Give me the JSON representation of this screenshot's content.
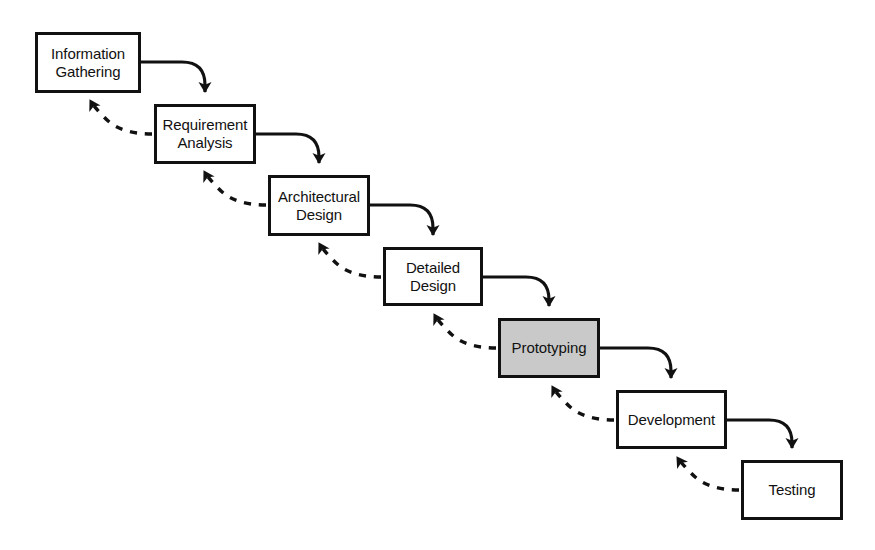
{
  "diagram": {
    "type": "process-flow",
    "canvas": {
      "width": 875,
      "height": 550
    },
    "colors": {
      "background": "#ffffff",
      "stroke": "#111111",
      "node_fill": "#ffffff",
      "highlight_fill": "#c9c9c9"
    },
    "nodes": [
      {
        "id": "information-gathering",
        "label": "Information\nGathering",
        "x": 35,
        "y": 32,
        "w": 106,
        "h": 61,
        "highlighted": false
      },
      {
        "id": "requirement-analysis",
        "label": "Requirement\nAnalysis",
        "x": 154,
        "y": 104,
        "w": 102,
        "h": 60,
        "highlighted": false
      },
      {
        "id": "architectural-design",
        "label": "Architectural\nDesign",
        "x": 268,
        "y": 175,
        "w": 102,
        "h": 61,
        "highlighted": false
      },
      {
        "id": "detailed-design",
        "label": "Detailed\nDesign",
        "x": 383,
        "y": 247,
        "w": 100,
        "h": 59,
        "highlighted": false
      },
      {
        "id": "prototyping",
        "label": "Prototyping",
        "x": 498,
        "y": 318,
        "w": 102,
        "h": 60,
        "highlighted": true
      },
      {
        "id": "development",
        "label": "Development",
        "x": 616,
        "y": 390,
        "w": 111,
        "h": 59,
        "highlighted": false
      },
      {
        "id": "testing",
        "label": "Testing",
        "x": 741,
        "y": 460,
        "w": 102,
        "h": 60,
        "highlighted": false
      }
    ],
    "forward_edges": [
      {
        "id": "ig-to-ra",
        "from": "information-gathering",
        "to": "requirement-analysis",
        "style": "solid"
      },
      {
        "id": "ra-to-ad",
        "from": "requirement-analysis",
        "to": "architectural-design",
        "style": "solid"
      },
      {
        "id": "ad-to-dd",
        "from": "architectural-design",
        "to": "detailed-design",
        "style": "solid"
      },
      {
        "id": "dd-to-pr",
        "from": "detailed-design",
        "to": "prototyping",
        "style": "solid"
      },
      {
        "id": "pr-to-dv",
        "from": "prototyping",
        "to": "development",
        "style": "solid"
      },
      {
        "id": "dv-to-ts",
        "from": "development",
        "to": "testing",
        "style": "solid"
      }
    ],
    "feedback_edges": [
      {
        "id": "ra-to-ig",
        "from": "requirement-analysis",
        "to": "information-gathering",
        "style": "dashed"
      },
      {
        "id": "ad-to-ra",
        "from": "architectural-design",
        "to": "requirement-analysis",
        "style": "dashed"
      },
      {
        "id": "dd-to-ad",
        "from": "detailed-design",
        "to": "architectural-design",
        "style": "dashed"
      },
      {
        "id": "pr-to-dd",
        "from": "prototyping",
        "to": "detailed-design",
        "style": "dashed"
      },
      {
        "id": "dv-to-pr",
        "from": "development",
        "to": "prototyping",
        "style": "dashed"
      },
      {
        "id": "ts-to-dv",
        "from": "testing",
        "to": "development",
        "style": "dashed"
      }
    ]
  }
}
